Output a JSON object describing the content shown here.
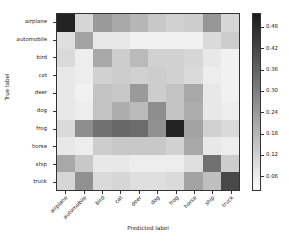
{
  "chart_data": {
    "type": "heatmap",
    "title": "",
    "xlabel": "Predicted label",
    "ylabel": "True label",
    "categories_x": [
      "airplane",
      "automobile",
      "bird",
      "cat",
      "deer",
      "dog",
      "frog",
      "horse",
      "ship",
      "truck"
    ],
    "categories_y": [
      "airplane",
      "automobile",
      "bird",
      "cat",
      "deer",
      "dog",
      "frog",
      "horse",
      "ship",
      "truck"
    ],
    "colorbar": {
      "ticks": [
        "0.06",
        "0.12",
        "0.18",
        "0.24",
        "0.30",
        "0.36",
        "0.42",
        "0.48"
      ],
      "tick_values": [
        0.06,
        0.12,
        0.18,
        0.24,
        0.3,
        0.36,
        0.42,
        0.48
      ],
      "vmin": 0.02,
      "vmax": 0.52,
      "colormap": "gray_reversed",
      "low_color": "#ffffff",
      "high_color": "#1a1a1a",
      "position": "right"
    },
    "grid": false,
    "legend": "none",
    "values": [
      [
        0.5,
        0.11,
        0.24,
        0.21,
        0.18,
        0.14,
        0.12,
        0.13,
        0.25,
        0.11
      ],
      [
        0.09,
        0.22,
        0.07,
        0.07,
        0.05,
        0.05,
        0.05,
        0.05,
        0.1,
        0.13
      ],
      [
        0.1,
        0.06,
        0.21,
        0.13,
        0.17,
        0.12,
        0.12,
        0.11,
        0.07,
        0.05
      ],
      [
        0.07,
        0.06,
        0.12,
        0.13,
        0.12,
        0.13,
        0.12,
        0.1,
        0.06,
        0.05
      ],
      [
        0.07,
        0.05,
        0.15,
        0.14,
        0.24,
        0.13,
        0.15,
        0.21,
        0.07,
        0.05
      ],
      [
        0.07,
        0.06,
        0.15,
        0.2,
        0.17,
        0.27,
        0.15,
        0.2,
        0.07,
        0.06
      ],
      [
        0.1,
        0.27,
        0.33,
        0.35,
        0.34,
        0.26,
        0.5,
        0.22,
        0.12,
        0.1
      ],
      [
        0.07,
        0.06,
        0.13,
        0.14,
        0.14,
        0.14,
        0.12,
        0.21,
        0.07,
        0.06
      ],
      [
        0.21,
        0.14,
        0.07,
        0.07,
        0.06,
        0.06,
        0.06,
        0.09,
        0.33,
        0.13
      ],
      [
        0.11,
        0.26,
        0.1,
        0.11,
        0.09,
        0.09,
        0.1,
        0.22,
        0.16,
        0.42
      ]
    ]
  }
}
